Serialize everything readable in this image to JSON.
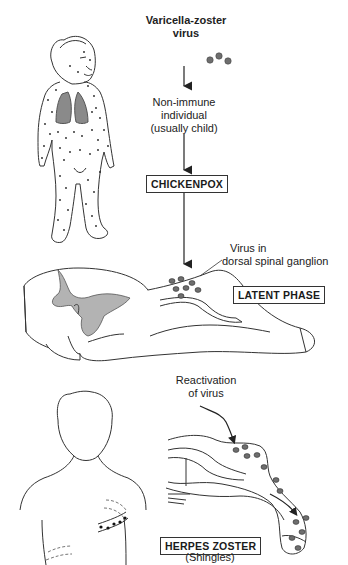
{
  "diagram": {
    "nodes": {
      "virus": {
        "line1": "Varicella-zoster",
        "line2": "virus"
      },
      "host": {
        "line1": "Non-immune",
        "line2": "individual",
        "line3": "(usually child)"
      },
      "chickenpox": {
        "label": "CHICKENPOX"
      },
      "ganglion": {
        "line1": "Virus in",
        "line2": "dorsal spinal ganglion"
      },
      "latent": {
        "label": "LATENT PHASE"
      },
      "reactivation": {
        "line1": "Reactivation",
        "line2": "of virus"
      },
      "zoster": {
        "label": "HERPES ZOSTER",
        "sublabel": "(Shingles)"
      }
    },
    "illustrations": [
      "child-with-chickenpox-rash-and-shaded-lungs",
      "spinal-cord-cross-section-with-dorsal-root-ganglion",
      "adult-torso-with-dermatomal-shingles-band",
      "sensory-nerve-with-virus-travelling-to-skin"
    ],
    "flow": [
      "virus",
      "host",
      "chickenpox",
      "latent",
      "reactivation",
      "zoster"
    ],
    "colors": {
      "line": "#2a2a2a",
      "grey_matter": "#b3b3b3",
      "lung": "#8a8a8a",
      "virus_particle": "#6e6e6e"
    }
  }
}
